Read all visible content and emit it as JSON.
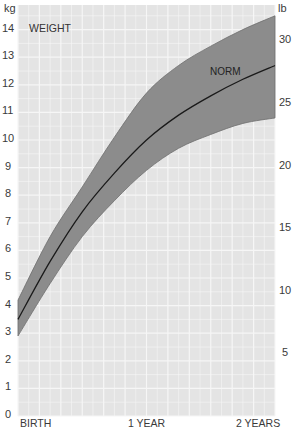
{
  "chart_data": {
    "type": "area",
    "title": "WEIGHT",
    "band_label": "NORM",
    "xlabel": "",
    "ylabel_left": "kg",
    "ylabel_right": "lb",
    "x_tick_labels": [
      "BIRTH",
      "1 YEAR",
      "2 YEARS"
    ],
    "x_months": [
      0,
      3,
      6,
      9,
      12,
      15,
      18,
      21,
      24
    ],
    "y_left_ticks": [
      0,
      1,
      2,
      3,
      4,
      5,
      6,
      7,
      8,
      9,
      10,
      11,
      12,
      13,
      14
    ],
    "y_right_ticks": [
      5,
      10,
      15,
      20,
      25,
      30
    ],
    "ylim_kg": [
      0,
      15
    ],
    "grid": true,
    "series": [
      {
        "name": "upper",
        "values": [
          4.2,
          6.5,
          8.3,
          10.1,
          11.7,
          12.7,
          13.4,
          14.0,
          14.5
        ]
      },
      {
        "name": "NORM",
        "values": [
          3.5,
          5.6,
          7.4,
          8.8,
          10.0,
          10.9,
          11.6,
          12.2,
          12.7
        ]
      },
      {
        "name": "lower",
        "values": [
          2.9,
          4.8,
          6.5,
          7.8,
          8.9,
          9.7,
          10.2,
          10.6,
          10.8
        ]
      }
    ],
    "colors": {
      "background": "#e6e6e6",
      "grid": "#f7f7f7",
      "band": "#8a8a8a",
      "norm_line": "#1a1a1a"
    }
  },
  "labels": {
    "kg_unit": "kg",
    "lb_unit": "lb",
    "title": "WEIGHT",
    "norm": "NORM",
    "birth": "BIRTH",
    "one_year": "1 YEAR",
    "two_years": "2 YEARS"
  }
}
